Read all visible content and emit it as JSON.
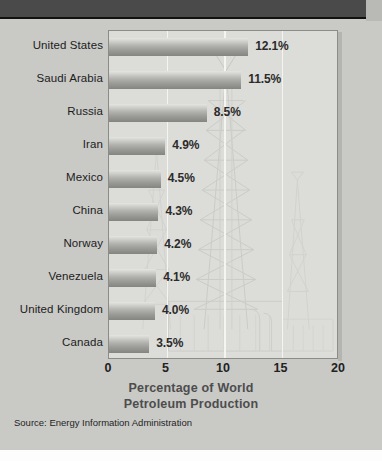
{
  "header": {
    "band_label": ""
  },
  "chart_data": {
    "type": "bar",
    "orientation": "horizontal",
    "title": "Percentage of World Petroleum Production",
    "title_line1": "Percentage of World",
    "title_line2": "Petroleum Production",
    "xlabel": "Percentage of World Petroleum Production",
    "ylabel": "",
    "xlim": [
      0,
      20
    ],
    "xticks": [
      0,
      5,
      10,
      15,
      20
    ],
    "xtick_labels": [
      "0",
      "5",
      "10",
      "15",
      "20"
    ],
    "grid": true,
    "gridlines_at": [
      5,
      10,
      15
    ],
    "legend": null,
    "categories": [
      "United States",
      "Saudi Arabia",
      "Russia",
      "Iran",
      "Mexico",
      "China",
      "Norway",
      "Venezuela",
      "United Kingdom",
      "Canada"
    ],
    "values": [
      12.1,
      11.5,
      8.5,
      4.9,
      4.5,
      4.3,
      4.2,
      4.1,
      4.0,
      3.5
    ],
    "value_labels": [
      "12.1%",
      "11.5%",
      "8.5%",
      "4.9%",
      "4.5%",
      "4.3%",
      "4.2%",
      "4.1%",
      "4.0%",
      "3.5%"
    ],
    "source": "Source:  Energy Information Administration",
    "colors": {
      "page_background": "#c9c9c6",
      "plot_background": "#dcdcd8",
      "bar_light": "#e4e4e1",
      "bar_dark": "#848481",
      "gridline": "#f4f4f1",
      "axis_text": "#222222",
      "title_text": "#4d4d4d",
      "header_band": "#4a4a4a"
    }
  }
}
